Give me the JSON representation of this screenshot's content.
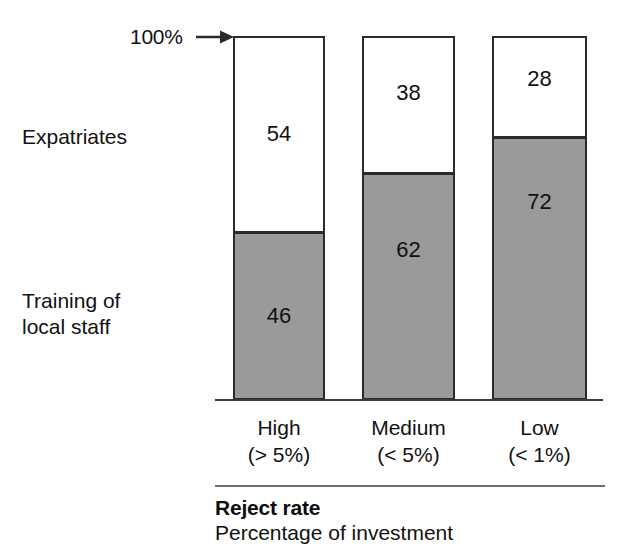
{
  "axis": {
    "max_label": "100%",
    "arrow_icon": "right-arrow-icon"
  },
  "series_labels": {
    "top": "Expatriates",
    "bottom": "Training of\nlocal staff"
  },
  "caption": {
    "title": "Reject rate",
    "subtitle": "Percentage of investment",
    "rule": "horizontal-rule"
  },
  "colors": {
    "top_segment_fill": "#ffffff",
    "bottom_segment_fill": "#9a9a9a",
    "segment_stroke": "#2b2b2b",
    "axis_line": "#3a3a3a",
    "caption_rule": "#6e6e6e",
    "text": "#111111"
  },
  "chart_data": {
    "type": "bar",
    "subtype": "stacked-100-percent",
    "title": "Reject rate",
    "subtitle": "Percentage of investment",
    "xlabel": "Reject rate",
    "ylabel": "",
    "ylim": [
      0,
      100
    ],
    "grid": false,
    "legend_position": "left-inline",
    "orientation": "vertical",
    "stack_order": [
      "Training of local staff",
      "Expatriates"
    ],
    "categories": [
      "High",
      "Medium",
      "Low"
    ],
    "category_sublabels": [
      "(> 5%)",
      "(< 5%)",
      "(< 1%)"
    ],
    "category_labels_full": [
      "High\n(> 5%)",
      "Medium\n(< 5%)",
      "Low\n(< 1%)"
    ],
    "axis_annotations": [
      {
        "text": "100%",
        "value": 100,
        "points_to": "top-of-first-bar"
      }
    ],
    "series": [
      {
        "name": "Expatriates",
        "fill": "#ffffff",
        "position": "top",
        "values": [
          54,
          38,
          28
        ]
      },
      {
        "name": "Training of local staff",
        "fill": "#9a9a9a",
        "position": "bottom",
        "values": [
          46,
          62,
          72
        ]
      }
    ],
    "bars": [
      {
        "category": "High",
        "sublabel": "(> 5%)",
        "segments": [
          {
            "series": "Expatriates",
            "value": 54
          },
          {
            "series": "Training of local staff",
            "value": 46
          }
        ],
        "total": 100
      },
      {
        "category": "Medium",
        "sublabel": "(< 5%)",
        "segments": [
          {
            "series": "Expatriates",
            "value": 38
          },
          {
            "series": "Training of local staff",
            "value": 62
          }
        ],
        "total": 100
      },
      {
        "category": "Low",
        "sublabel": "(< 1%)",
        "segments": [
          {
            "series": "Expatriates",
            "value": 28
          },
          {
            "series": "Training of local staff",
            "value": 72
          }
        ],
        "total": 100
      }
    ]
  }
}
